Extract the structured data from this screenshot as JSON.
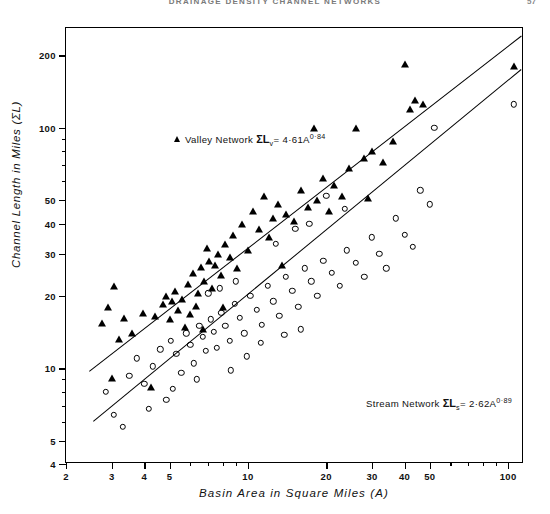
{
  "page": {
    "running_head": "DRAINAGE DENSITY CHANNEL NETWORKS",
    "folio": "57"
  },
  "chart_data": {
    "type": "scatter",
    "title": "",
    "xlabel": "Basin  Area  in  Square  Miles  (A)",
    "ylabel": "Channel  Length  in  Miles  (ΣL)",
    "xscale": "log",
    "yscale": "log",
    "xlim": [
      2.0,
      115
    ],
    "ylim": [
      4,
      260
    ],
    "grid": false,
    "xticks": [
      2,
      3,
      4,
      5,
      10,
      20,
      30,
      40,
      50,
      100
    ],
    "xtick_labels": [
      "2",
      "3",
      "4",
      "5",
      "10",
      "20",
      "30",
      "40",
      "50",
      "100"
    ],
    "xminor": [
      6,
      7,
      8,
      9,
      60,
      70,
      80,
      90
    ],
    "yticks": [
      4,
      5,
      10,
      20,
      30,
      40,
      50,
      100,
      200
    ],
    "ytick_labels": [
      "4",
      "5",
      "10",
      "20",
      "30",
      "40",
      "50",
      "100",
      "200"
    ],
    "yminor": [
      6,
      7,
      8,
      9,
      60,
      70,
      80,
      90
    ],
    "legend_position": "upper-left-inside",
    "series": [
      {
        "name": "Valley Network",
        "marker": "filled-triangle",
        "label": "Valley Network",
        "equation_lhs": "ΣL",
        "equation_sub": "v",
        "equation_coef": "4·61",
        "equation_base": "A",
        "equation_exp": "0·84",
        "fit_coefficient": 4.61,
        "fit_exponent": 0.84,
        "points": [
          [
            2.75,
            15.5
          ],
          [
            2.9,
            18.0
          ],
          [
            3.05,
            22.0
          ],
          [
            3.2,
            13.2
          ],
          [
            3.0,
            9.1
          ],
          [
            3.35,
            16.2
          ],
          [
            3.6,
            14.0
          ],
          [
            3.95,
            17.0
          ],
          [
            4.25,
            8.4
          ],
          [
            4.4,
            16.5
          ],
          [
            4.7,
            18.5
          ],
          [
            4.85,
            20.0
          ],
          [
            5.0,
            16.0
          ],
          [
            5.1,
            19.0
          ],
          [
            5.25,
            21.0
          ],
          [
            5.4,
            17.5
          ],
          [
            5.6,
            19.5
          ],
          [
            5.75,
            14.8
          ],
          [
            5.9,
            22.5
          ],
          [
            6.0,
            16.8
          ],
          [
            6.15,
            25.0
          ],
          [
            6.3,
            18.2
          ],
          [
            6.45,
            20.5
          ],
          [
            6.6,
            26.5
          ],
          [
            6.8,
            23.0
          ],
          [
            6.95,
            31.5
          ],
          [
            7.1,
            28.0
          ],
          [
            7.3,
            21.5
          ],
          [
            7.5,
            27.0
          ],
          [
            7.7,
            30.0
          ],
          [
            7.9,
            24.5
          ],
          [
            8.2,
            33.0
          ],
          [
            8.5,
            29.0
          ],
          [
            8.8,
            36.0
          ],
          [
            9.1,
            26.0
          ],
          [
            9.5,
            40.0
          ],
          [
            10.0,
            31.0
          ],
          [
            10.5,
            45.0
          ],
          [
            11.0,
            38.0
          ],
          [
            11.5,
            52.0
          ],
          [
            12.0,
            35.0
          ],
          [
            12.5,
            42.0
          ],
          [
            13.0,
            48.0
          ],
          [
            14.0,
            44.0
          ],
          [
            15.0,
            41.0
          ],
          [
            16.0,
            55.0
          ],
          [
            17.0,
            47.0
          ],
          [
            18.0,
            100.0
          ],
          [
            18.5,
            50.0
          ],
          [
            19.5,
            62.0
          ],
          [
            20.5,
            45.0
          ],
          [
            21.5,
            58.0
          ],
          [
            23.0,
            52.0
          ],
          [
            24.5,
            68.0
          ],
          [
            26.0,
            100.0
          ],
          [
            28.0,
            75.0
          ],
          [
            30.0,
            80.0
          ],
          [
            33.0,
            72.0
          ],
          [
            36.0,
            88.0
          ],
          [
            40.0,
            185.0
          ],
          [
            42.0,
            120.0
          ],
          [
            44.0,
            130.0
          ],
          [
            47.0,
            125.0
          ],
          [
            105.0,
            180.0
          ],
          [
            6.7,
            14.5
          ],
          [
            8.0,
            18.0
          ],
          [
            13.5,
            27.0
          ],
          [
            29.0,
            51.0
          ]
        ]
      },
      {
        "name": "Stream Network",
        "marker": "open-circle",
        "label": "Stream Network",
        "equation_lhs": "ΣL",
        "equation_sub": "s",
        "equation_coef": "2·62",
        "equation_base": "A",
        "equation_exp": "0·89",
        "fit_coefficient": 2.62,
        "fit_exponent": 0.89,
        "points": [
          [
            2.85,
            8.0
          ],
          [
            3.05,
            6.4
          ],
          [
            3.3,
            5.7
          ],
          [
            3.5,
            9.3
          ],
          [
            3.75,
            11.0
          ],
          [
            4.0,
            8.6
          ],
          [
            4.3,
            10.2
          ],
          [
            4.6,
            12.0
          ],
          [
            4.85,
            7.4
          ],
          [
            5.05,
            13.0
          ],
          [
            5.3,
            11.5
          ],
          [
            5.55,
            9.6
          ],
          [
            5.8,
            14.0
          ],
          [
            6.0,
            12.5
          ],
          [
            6.2,
            10.5
          ],
          [
            6.5,
            15.0
          ],
          [
            6.7,
            13.5
          ],
          [
            6.9,
            11.8
          ],
          [
            7.2,
            16.0
          ],
          [
            7.4,
            14.2
          ],
          [
            7.6,
            12.2
          ],
          [
            7.9,
            17.0
          ],
          [
            8.2,
            15.0
          ],
          [
            8.5,
            13.0
          ],
          [
            8.9,
            18.5
          ],
          [
            9.3,
            16.2
          ],
          [
            9.7,
            14.0
          ],
          [
            10.2,
            20.0
          ],
          [
            10.8,
            17.5
          ],
          [
            11.3,
            15.2
          ],
          [
            11.9,
            22.0
          ],
          [
            12.5,
            19.0
          ],
          [
            13.2,
            16.5
          ],
          [
            14.0,
            24.0
          ],
          [
            14.8,
            21.0
          ],
          [
            15.6,
            18.0
          ],
          [
            16.5,
            26.0
          ],
          [
            17.5,
            23.0
          ],
          [
            18.5,
            20.0
          ],
          [
            19.5,
            28.0
          ],
          [
            21.0,
            25.0
          ],
          [
            22.5,
            22.0
          ],
          [
            24.0,
            31.0
          ],
          [
            26.0,
            27.5
          ],
          [
            28.0,
            24.0
          ],
          [
            30.0,
            35.0
          ],
          [
            32.0,
            30.0
          ],
          [
            34.0,
            26.0
          ],
          [
            37.0,
            42.0
          ],
          [
            40.0,
            36.0
          ],
          [
            43.0,
            32.0
          ],
          [
            46.0,
            55.0
          ],
          [
            50.0,
            48.0
          ],
          [
            52.0,
            100.0
          ],
          [
            105.0,
            125.0
          ],
          [
            7.05,
            20.5
          ],
          [
            7.8,
            21.5
          ],
          [
            9.0,
            23.0
          ],
          [
            12.8,
            33.0
          ],
          [
            15.2,
            38.0
          ],
          [
            17.2,
            40.0
          ],
          [
            20.0,
            52.0
          ],
          [
            23.5,
            46.0
          ],
          [
            5.15,
            8.2
          ],
          [
            6.35,
            9.0
          ],
          [
            4.15,
            6.8
          ],
          [
            8.6,
            9.8
          ],
          [
            9.9,
            11.2
          ],
          [
            11.2,
            12.8
          ],
          [
            13.8,
            13.8
          ],
          [
            16.0,
            14.5
          ]
        ]
      }
    ]
  }
}
